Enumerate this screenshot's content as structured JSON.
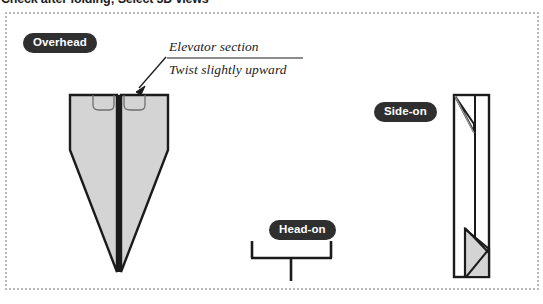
{
  "page": {
    "title": "Check after folding; Select 3D views",
    "background_color": "#ffffff"
  },
  "figure": {
    "frame": {
      "border_style": "dotted",
      "border_color": "#b9b9b9",
      "x": 5,
      "y": 12,
      "width": 534,
      "height": 278
    },
    "palette": {
      "ink": "#1b1b1b",
      "paper_fill": "#d4d4d4",
      "pill_bg": "#2f2f2f",
      "pill_text": "#ffffff",
      "frame_border": "#b9b9b9"
    },
    "labels": {
      "overhead": "Overhead",
      "side_on": "Side-on",
      "head_on": "Head-on"
    },
    "annotations": {
      "elevator": "Elevator section",
      "twist": "Twist slightly upward"
    },
    "views": [
      {
        "name": "overhead",
        "label": "Overhead",
        "description": "Dart plane seen from above with two rounded elevator tabs at the tail edge and a centre spine"
      },
      {
        "name": "head-on",
        "label": "Head-on",
        "description": "Wings forming a shallow bracket with upturned tips and a central vertical fin"
      },
      {
        "name": "side-on",
        "label": "Side-on",
        "description": "Tall narrow profile with folded wing slivers at the top and a shaded triangular nose wedge at the bottom"
      }
    ]
  }
}
